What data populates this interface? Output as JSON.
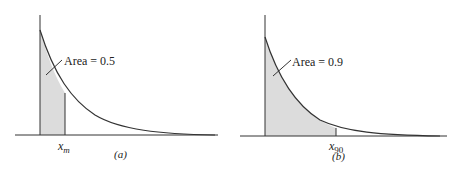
{
  "panels": [
    {
      "id": "a",
      "caption": "(a)",
      "area_label": "Area = 0.5",
      "x_marker": "x",
      "x_marker_sub": "m",
      "area_fraction": 0.5
    },
    {
      "id": "b",
      "caption": "(b)",
      "area_label": "Area = 0.9",
      "x_marker": "x",
      "x_marker_sub": "90",
      "area_fraction": 0.9
    }
  ],
  "colors": {
    "shade": "#dcdcdc",
    "line": "#333333"
  }
}
